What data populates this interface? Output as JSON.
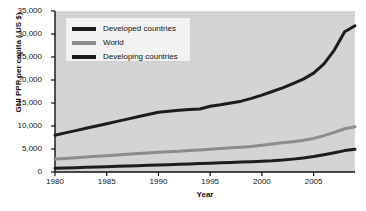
{
  "chart_data": {
    "type": "line",
    "title": "",
    "xlabel": "Year",
    "ylabel": "GNI PPP per capita ( US $)",
    "xlim": [
      1980,
      2009
    ],
    "ylim": [
      0,
      35000
    ],
    "grid": false,
    "legend_position": "top-left",
    "xticks": [
      "1980",
      "1985",
      "1990",
      "1995",
      "2000",
      "2005"
    ],
    "xtick_values": [
      1980,
      1985,
      1990,
      1995,
      2000,
      2005
    ],
    "yticks": [
      "0",
      "5,000",
      "10,000",
      "15,000",
      "20,000",
      "25,000",
      "30,000",
      "35,000"
    ],
    "ytick_values": [
      0,
      5000,
      10000,
      15000,
      20000,
      25000,
      30000,
      35000
    ],
    "x": [
      1980,
      1981,
      1982,
      1983,
      1984,
      1985,
      1986,
      1987,
      1988,
      1989,
      1990,
      1991,
      1992,
      1993,
      1994,
      1995,
      1996,
      1997,
      1998,
      1999,
      2000,
      2001,
      2002,
      2003,
      2004,
      2005,
      2006,
      2007,
      2008,
      2009
    ],
    "series": [
      {
        "name": "Developed countries",
        "color": "#1c1c1c",
        "width": 3,
        "values": [
          8000,
          8500,
          9000,
          9500,
          10000,
          10500,
          11000,
          11500,
          12000,
          12500,
          13000,
          13200,
          13400,
          13600,
          13700,
          14300,
          14600,
          15000,
          15400,
          16000,
          16700,
          17500,
          18300,
          19200,
          20200,
          21500,
          23500,
          26500,
          30500,
          31800
        ]
      },
      {
        "name": "World",
        "color": "#8c8c8c",
        "width": 3,
        "values": [
          2800,
          2950,
          3100,
          3250,
          3400,
          3550,
          3700,
          3850,
          4000,
          4150,
          4300,
          4400,
          4500,
          4650,
          4800,
          4950,
          5100,
          5250,
          5400,
          5550,
          5800,
          6100,
          6350,
          6600,
          6900,
          7300,
          7900,
          8600,
          9400,
          9850
        ]
      },
      {
        "name": "Developing countries",
        "color": "#1c1c1c",
        "width": 3,
        "values": [
          800,
          880,
          950,
          1020,
          1090,
          1160,
          1230,
          1300,
          1380,
          1450,
          1520,
          1600,
          1680,
          1760,
          1840,
          1920,
          2000,
          2080,
          2160,
          2250,
          2350,
          2450,
          2600,
          2800,
          3050,
          3350,
          3750,
          4200,
          4650,
          4950
        ]
      }
    ]
  },
  "legend": {
    "items": [
      {
        "label": "Developed countries"
      },
      {
        "label": "World"
      },
      {
        "label": "Developing countries"
      }
    ]
  },
  "axes": {
    "y_title": "GNI PPP per capita ( US $)",
    "x_title": "Year"
  },
  "colors": {
    "plot_background": "#d4d4d4",
    "axis": "#111111",
    "developed": "#1c1c1c",
    "world": "#8c8c8c",
    "developing": "#1c1c1c",
    "legend_background": "#f2f2f2"
  }
}
